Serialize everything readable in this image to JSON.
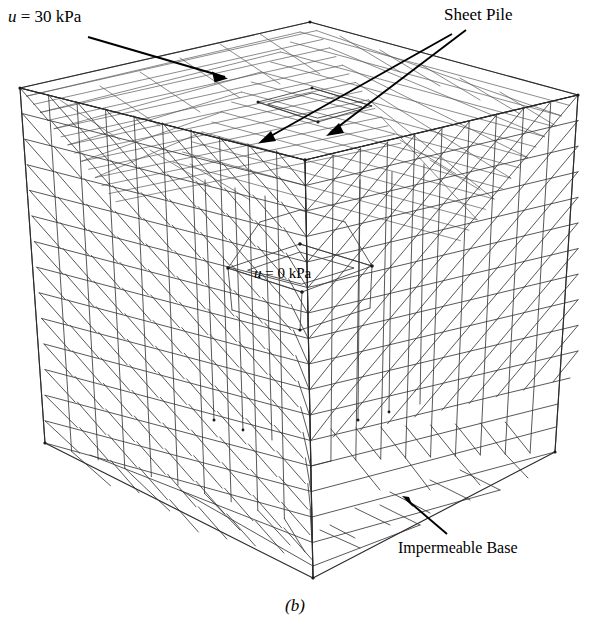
{
  "figure": {
    "caption": "(b)",
    "type": "3d-finite-element-mesh"
  },
  "labels": {
    "pore_pressure_top": {
      "text": "u = 30 kPa",
      "symbol": "u",
      "value": "30",
      "unit": "kPa",
      "position": "top-left"
    },
    "sheet_pile": {
      "text": "Sheet Pile",
      "position": "top-right"
    },
    "pore_pressure_excavation": {
      "text": "u = 0 kPa",
      "symbol": "u",
      "value": "0",
      "unit": "kPa",
      "position": "center"
    },
    "impermeable_base": {
      "text": "Impermeable Base",
      "position": "bottom-right"
    }
  },
  "colors": {
    "mesh_line": "#3a3a3a",
    "mesh_outline": "#2b2b2b",
    "annotation": "#000000",
    "background": "#ffffff"
  },
  "geometry": {
    "top_back": [
      310,
      22
    ],
    "top_left": [
      20,
      88
    ],
    "top_right": [
      578,
      95
    ],
    "top_front": [
      305,
      160
    ],
    "bottom_left": [
      45,
      443
    ],
    "bottom_right": [
      555,
      452
    ],
    "bottom_front": [
      313,
      578
    ]
  }
}
